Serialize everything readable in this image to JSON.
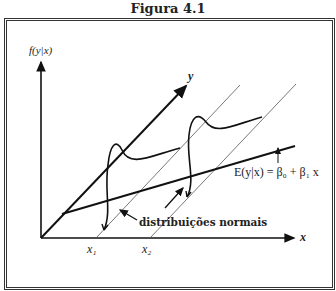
{
  "figure": {
    "title": "Figura 4.1",
    "labels": {
      "vertical_axis": "f(y|x)",
      "horizontal_axis": "x",
      "diagonal_axis": "y",
      "x1": "x₁",
      "x2": "x₂",
      "regression_equation": "E(y|x) = β₀ + β₁ x",
      "curves_annotation": "distribuições normais"
    },
    "colors": {
      "line": "#111111",
      "thin_line": "#555555",
      "border": "#333333"
    }
  }
}
